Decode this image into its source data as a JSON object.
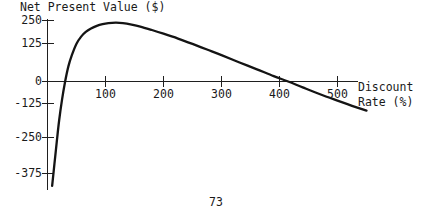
{
  "document": {
    "page_number": "73"
  },
  "chart_data": {
    "type": "line",
    "title": "Net Present Value ($)",
    "xlabel": "Discount Rate (%)",
    "ylabel": "Net Present Value ($)",
    "xlabel_line1": "Discount",
    "xlabel_line2": "Rate (%)",
    "grid": false,
    "legend": null,
    "xlim": [
      0,
      560
    ],
    "ylim": [
      -430,
      260
    ],
    "xticks": [
      100,
      200,
      300,
      400,
      500
    ],
    "xtick_labels": [
      "100",
      "200",
      "300",
      "400",
      "500"
    ],
    "yticks": [
      250,
      125,
      0,
      -125,
      -250,
      -375
    ],
    "ytick_labels": [
      "250",
      "125",
      "0",
      "-125",
      "-250",
      "-375"
    ],
    "annotations": [],
    "series": [
      {
        "name": "Net Present Value",
        "color": "#141414",
        "x": [
          8,
          12,
          16,
          20,
          25,
          30,
          36,
          42,
          50,
          58,
          66,
          75,
          85,
          95,
          105,
          118,
          130,
          145,
          160,
          180,
          200,
          225,
          250,
          275,
          300,
          330,
          360,
          390,
          415,
          440,
          470,
          500,
          525,
          550
        ],
        "y": [
          -425,
          -335,
          -245,
          -160,
          -75,
          -5,
          62,
          108,
          155,
          184,
          203,
          217,
          228,
          235,
          239,
          241,
          239,
          233,
          225,
          211,
          196,
          176,
          154,
          131,
          108,
          79,
          51,
          22,
          0,
          -24,
          -52,
          -78,
          -99,
          -119
        ]
      }
    ]
  },
  "axes": {
    "x_axis_name": "discount-rate-axis",
    "y_axis_name": "net-present-value-axis"
  }
}
